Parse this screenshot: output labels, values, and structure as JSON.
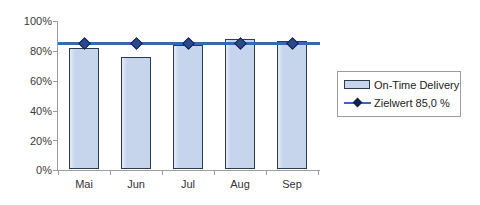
{
  "chart_data": {
    "type": "bar",
    "title": "",
    "subtitle": "",
    "xlabel": "",
    "ylabel": "",
    "categories": [
      "Mai",
      "Jun",
      "Jul",
      "Aug",
      "Sep"
    ],
    "ylim": [
      0,
      100
    ],
    "y_ticks": [
      0,
      20,
      40,
      60,
      80,
      100
    ],
    "y_tick_labels": [
      "0%",
      "20%",
      "40%",
      "60%",
      "80%",
      "100%"
    ],
    "grid": false,
    "legend_position": "right",
    "series": [
      {
        "name": "On-Time Delivery",
        "type": "bar",
        "color": "#c6d4ec",
        "edge_color": "#2b3a55",
        "values": [
          81,
          75,
          83,
          87,
          86
        ]
      },
      {
        "name": "Zielwert 85,0 %",
        "type": "line",
        "color": "#3b66b0",
        "marker_color": "#2b4a8c",
        "values": [
          85,
          85,
          85,
          85,
          85
        ]
      }
    ]
  },
  "legend": {
    "items": [
      {
        "label": "On-Time Delivery",
        "key": "bar-swatch"
      },
      {
        "label": "Zielwert 85,0 %",
        "key": "line-marker-swatch"
      }
    ]
  },
  "colors": {
    "bar_fill": "#c6d4ec",
    "bar_edge": "#2b3a55",
    "target_line": "#3b66b0",
    "marker": "#2b4a8c",
    "axis": "#9c9c9c",
    "background": "#ffffff",
    "text": "#333333"
  }
}
